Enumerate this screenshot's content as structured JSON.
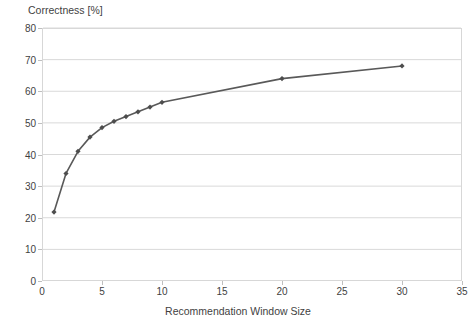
{
  "chart_data": {
    "type": "line",
    "title": "",
    "xlabel": "Recommendation Window Size",
    "ylabel": "Correctness [%]",
    "xlim": [
      0,
      35
    ],
    "ylim": [
      0,
      80
    ],
    "xticks": [
      0,
      5,
      10,
      15,
      20,
      25,
      30,
      35
    ],
    "yticks": [
      0,
      10,
      20,
      30,
      40,
      50,
      60,
      70,
      80
    ],
    "grid": "horizontal",
    "legend": "none",
    "marker": "diamond",
    "line_color": "#595959",
    "marker_color": "#4d4d4d",
    "series": [
      {
        "name": "Correctness",
        "x": [
          1,
          2,
          3,
          4,
          5,
          6,
          7,
          8,
          9,
          10,
          20,
          30
        ],
        "values": [
          21.8,
          34.0,
          41.0,
          45.5,
          48.5,
          50.5,
          52.0,
          53.5,
          55.0,
          56.5,
          64.0,
          68.0
        ]
      }
    ]
  },
  "axes": {
    "y_label_text": "Correctness [%]",
    "x_label_text": "Recommendation Window Size",
    "y_tick_texts": [
      "0",
      "10",
      "20",
      "30",
      "40",
      "50",
      "60",
      "70",
      "80"
    ],
    "x_tick_texts": [
      "0",
      "5",
      "10",
      "15",
      "20",
      "25",
      "30",
      "35"
    ]
  },
  "colors": {
    "line": "#595959",
    "marker": "#4d4d4d",
    "grid": "#d9d9d9",
    "frame": "#d7d7d7",
    "text": "#3f3f3f",
    "background": "#ffffff"
  }
}
